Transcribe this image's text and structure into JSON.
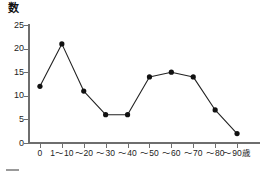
{
  "chart_data": {
    "type": "line",
    "title": "",
    "ylabel": "数",
    "xlabel": "歳",
    "ylim": [
      0,
      25
    ],
    "yticks": [
      0,
      5,
      10,
      15,
      20,
      25
    ],
    "ytick_labels": [
      "0",
      "5",
      "10",
      "15",
      "20",
      "25"
    ],
    "grid": false,
    "legend": "none",
    "categories": [
      "0",
      "1～10",
      "～20",
      "～30",
      "～40",
      "～50",
      "～60",
      "～70",
      "～80",
      "～90"
    ],
    "values": [
      12,
      21,
      11,
      6,
      6,
      14,
      15,
      14,
      7,
      2
    ],
    "marker": "filled-circle",
    "line_color": "#222222",
    "marker_color": "#111111",
    "axis_color": "#6e6e6e"
  },
  "axes": {
    "y_title": "数",
    "x_unit_suffix": "歳"
  },
  "caption": {
    "rule": "",
    "text": ""
  }
}
